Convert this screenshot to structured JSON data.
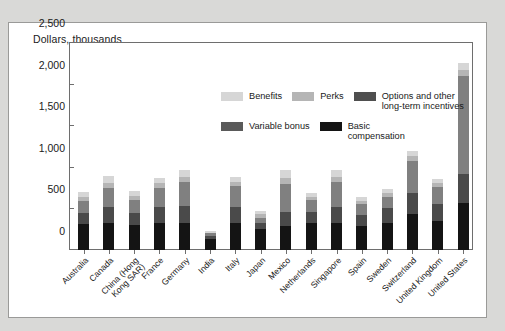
{
  "chart_data": {
    "type": "bar",
    "subtype": "stacked-bar",
    "title": "",
    "axis_title": "Dollars, thousands",
    "xlabel": "",
    "ylabel": "Dollars, thousands",
    "ylim": [
      0,
      2500
    ],
    "yticks": [
      0,
      500,
      1000,
      1500,
      2000,
      2500
    ],
    "ytick_labels": [
      "0",
      "500",
      "1,000",
      "1,500",
      "2,000",
      "2,500"
    ],
    "grid": false,
    "legend_position": "top-center-inside",
    "categories": [
      "Australia",
      "Canada",
      "China (Hong\nKong SAR)",
      "France",
      "Germany",
      "India",
      "Italy",
      "Japan",
      "Mexico",
      "Netherlands",
      "Singapore",
      "Spain",
      "Sweden",
      "Switzerland",
      "United Kingdom",
      "United States"
    ],
    "series": [
      {
        "name": "Basic compensation",
        "color": "#141414",
        "values": [
          310,
          330,
          300,
          330,
          330,
          130,
          330,
          250,
          290,
          320,
          330,
          290,
          330,
          430,
          350,
          560
        ]
      },
      {
        "name": "Variable bonus",
        "color": "#4a4a4a",
        "values": [
          140,
          190,
          150,
          190,
          200,
          40,
          190,
          80,
          170,
          140,
          190,
          130,
          170,
          260,
          200,
          350
        ]
      },
      {
        "name": "Options and other long-term incentives",
        "color": "#808080",
        "values": [
          140,
          230,
          150,
          230,
          290,
          30,
          250,
          60,
          330,
          140,
          300,
          130,
          140,
          380,
          210,
          1180
        ]
      },
      {
        "name": "Perks",
        "color": "#b5b5b5",
        "values": [
          50,
          60,
          50,
          50,
          60,
          10,
          50,
          40,
          80,
          40,
          60,
          40,
          40,
          60,
          40,
          70
        ]
      },
      {
        "name": "Benefits",
        "color": "#d6d6d6",
        "values": [
          60,
          80,
          60,
          60,
          80,
          15,
          60,
          40,
          90,
          50,
          80,
          50,
          50,
          60,
          50,
          90
        ]
      }
    ],
    "totals": [
      700,
      890,
      710,
      860,
      960,
      225,
      880,
      470,
      960,
      690,
      960,
      640,
      730,
      1190,
      850,
      2250
    ]
  },
  "legend": {
    "rows": [
      [
        {
          "label": "Benefits",
          "color": "#d6d6d6",
          "swatch_name": "legend-swatch-benefits"
        },
        {
          "label": "Perks",
          "color": "#b5b5b5",
          "swatch_name": "legend-swatch-perks"
        },
        {
          "label": "Options and other\nlong-term incentives",
          "color": "#4f4f4f",
          "swatch_name": "legend-swatch-options"
        }
      ],
      [
        {
          "label": "Variable bonus",
          "color": "#5a5a5a",
          "swatch_name": "legend-swatch-variable-bonus"
        },
        {
          "label": "Basic\ncompensation",
          "color": "#141414",
          "swatch_name": "legend-swatch-basic-compensation"
        }
      ]
    ]
  },
  "colors": {
    "background": "#d9d9d7",
    "card": "#ffffff",
    "card_border": "#9a9a98",
    "axis": "#6e6e6e",
    "text": "#1a1a1a"
  }
}
